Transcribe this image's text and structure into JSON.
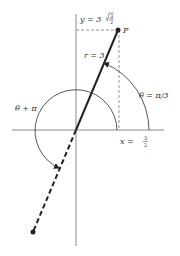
{
  "diagram": {
    "point_label": "P",
    "radius_label": "r = 3",
    "angle_label": "θ = π/3",
    "opposite_angle_label": "θ + π",
    "x_label_prefix": "x = ",
    "x_label_num": "3",
    "x_label_den": "2",
    "y_label_prefix": "y = 3",
    "y_label_sqrt_num": "3",
    "y_label_den": "2",
    "colors": {
      "line": "#222222",
      "axis": "#888888",
      "dashed_guide": "#888888",
      "text": "#333333"
    }
  }
}
